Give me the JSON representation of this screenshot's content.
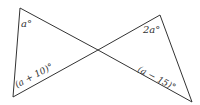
{
  "diagram": {
    "type": "bowtie-triangles",
    "stroke_color": "#333333",
    "background": "#ffffff",
    "left_triangle": {
      "top_angle_label": "a°",
      "bottom_angle_label": "(a + 10)°"
    },
    "right_triangle": {
      "top_angle_label": "2a°",
      "bottom_angle_label": "(a − 15)°"
    }
  }
}
